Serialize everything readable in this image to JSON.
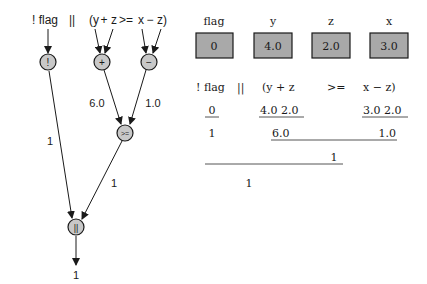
{
  "tree": {
    "expression": {
      "tokens": [
        {
          "text": "! flag",
          "x": 45
        },
        {
          "text": "||",
          "x": 72
        },
        {
          "text": "(y",
          "x": 94
        },
        {
          "text": "+",
          "x": 104
        },
        {
          "text": "z",
          "x": 114
        },
        {
          "text": ">=",
          "x": 126
        },
        {
          "text": "x",
          "x": 141
        },
        {
          "text": "−",
          "x": 150
        },
        {
          "text": "z)",
          "x": 162
        }
      ]
    },
    "nodes": {
      "not": {
        "label": "!",
        "cx": 48,
        "cy": 62
      },
      "plus": {
        "label": "+",
        "cx": 102,
        "cy": 62
      },
      "minus": {
        "label": "−",
        "cx": 149,
        "cy": 62
      },
      "gte": {
        "label": ">=",
        "cx": 125,
        "cy": 133
      },
      "or": {
        "label": "||",
        "cx": 76,
        "cy": 227
      }
    },
    "edge_labels": {
      "plus_to_gte": "6.0",
      "minus_to_gte": "1.0",
      "not_to_or": "1",
      "gte_to_or": "1",
      "result": "1"
    }
  },
  "variables": [
    {
      "name": "flag",
      "value": "0"
    },
    {
      "name": "y",
      "value": "4.0"
    },
    {
      "name": "z",
      "value": "2.0"
    },
    {
      "name": "x",
      "value": "3.0"
    }
  ],
  "evaluation": {
    "header": {
      "not_flag": "! flag",
      "or": "||",
      "y_plus_z": "(y  +  z",
      "gte": ">=",
      "x_minus_z": "x  −  z)"
    },
    "row1": {
      "flag_val": "0",
      "y_z_vals": "4.0   2.0",
      "x_z_vals": "3.0   2.0"
    },
    "row2": {
      "not_result": "1",
      "sum": "6.0",
      "diff": "1.0"
    },
    "row3": {
      "gte_result": "1"
    },
    "row4": {
      "final_result": "1"
    }
  },
  "colors": {
    "node_fill": "#c8c8c8",
    "box_fill": "#a9a9a9",
    "stroke": "#1a1a1a"
  }
}
